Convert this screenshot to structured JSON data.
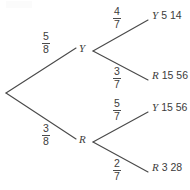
{
  "diagram": {
    "type": "probability-tree",
    "title": "",
    "root": {
      "label": ""
    },
    "level1": [
      {
        "node": "Y",
        "probability": {
          "numerator": "5",
          "denominator": "8"
        }
      },
      {
        "node": "R",
        "probability": {
          "numerator": "3",
          "denominator": "8"
        }
      }
    ],
    "level2": [
      {
        "parent": "Y",
        "node": "Y",
        "probability": {
          "numerator": "4",
          "denominator": "7"
        },
        "outcome": {
          "numerator": "5",
          "denominator": "14"
        }
      },
      {
        "parent": "Y",
        "node": "R",
        "probability": {
          "numerator": "3",
          "denominator": "7"
        },
        "outcome": {
          "numerator": "15",
          "denominator": "56"
        }
      },
      {
        "parent": "R",
        "node": "Y",
        "probability": {
          "numerator": "5",
          "denominator": "7"
        },
        "outcome": {
          "numerator": "15",
          "denominator": "56"
        }
      },
      {
        "parent": "R",
        "node": "R",
        "probability": {
          "numerator": "2",
          "denominator": "7"
        },
        "outcome": {
          "numerator": "3",
          "denominator": "28"
        }
      }
    ],
    "colors": {
      "line": "#4a4a4a",
      "text": "#3c3c3c",
      "background": "#ffffff"
    }
  }
}
